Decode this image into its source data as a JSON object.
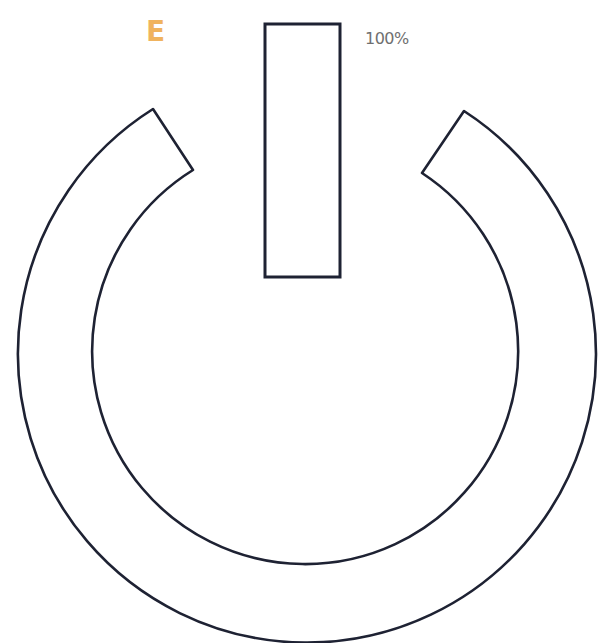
{
  "label": {
    "letter": "E",
    "percent": "100%"
  },
  "colors": {
    "letter": "#f0b35e",
    "percent": "#6f6f6f",
    "stroke": "#1e2233",
    "background": "#ffffff"
  },
  "icon": {
    "name": "power-icon",
    "parts": [
      "power-ring",
      "power-bar"
    ]
  }
}
